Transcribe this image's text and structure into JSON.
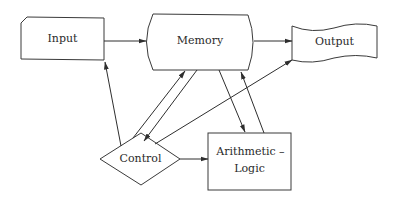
{
  "diagram": {
    "type": "computer-architecture-block-diagram",
    "nodes": {
      "input": {
        "label": "Input",
        "shape": "notched-rectangle"
      },
      "memory": {
        "label": "Memory",
        "shape": "curved-sided-rectangle"
      },
      "output": {
        "label": "Output",
        "shape": "document-wave"
      },
      "control": {
        "label": "Control",
        "shape": "diamond"
      },
      "arithmetic": {
        "label_line1": "Arithmetic –",
        "label_line2": "Logic",
        "shape": "rectangle"
      }
    },
    "edges": [
      {
        "from": "Input",
        "to": "Memory"
      },
      {
        "from": "Memory",
        "to": "Output"
      },
      {
        "from": "Control",
        "to": "Input"
      },
      {
        "from": "Control",
        "to": "Memory"
      },
      {
        "from": "Memory",
        "to": "Control"
      },
      {
        "from": "Control",
        "to": "Output"
      },
      {
        "from": "Memory",
        "to": "Arithmetic – Logic"
      },
      {
        "from": "Arithmetic – Logic",
        "to": "Memory"
      },
      {
        "from": "Control",
        "to": "Arithmetic – Logic"
      }
    ],
    "colors": {
      "stroke": "#3a3a3a",
      "text": "#2a2a2a",
      "background": "#ffffff"
    }
  }
}
